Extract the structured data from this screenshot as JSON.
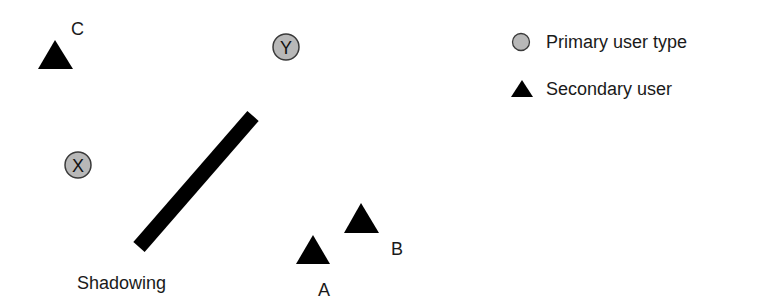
{
  "diagram": {
    "colors": {
      "primary_fill": "#b8b8b8",
      "primary_stroke": "#3a3a3a",
      "secondary_fill": "#000000",
      "barrier": "#000000",
      "text": "#1a1a1a"
    },
    "primary_users": [
      {
        "id": "Y",
        "label": "Y",
        "cx": 286,
        "cy": 47,
        "r": 13
      },
      {
        "id": "X",
        "label": "X",
        "cx": 78,
        "cy": 165,
        "r": 13
      }
    ],
    "secondary_users": [
      {
        "id": "C",
        "label": "C",
        "apex": [
          55,
          40
        ],
        "base_left": [
          38,
          69
        ],
        "base_right": [
          73,
          69
        ],
        "label_pos": [
          71,
          20
        ]
      },
      {
        "id": "A",
        "label": "A",
        "apex": [
          313,
          235
        ],
        "base_left": [
          296,
          264
        ],
        "base_right": [
          330,
          264
        ],
        "label_pos": [
          318,
          281
        ]
      },
      {
        "id": "B",
        "label": "B",
        "apex": [
          361,
          203
        ],
        "base_left": [
          344,
          233
        ],
        "base_right": [
          379,
          233
        ],
        "label_pos": [
          391,
          240
        ]
      }
    ],
    "barrier": {
      "label": "Shadowing",
      "x1": 139,
      "y1": 247,
      "x2": 253,
      "y2": 116,
      "width": 15,
      "label_pos": [
        77,
        274
      ]
    },
    "legend": {
      "items": [
        {
          "symbol": "circle",
          "label": "Primary user type"
        },
        {
          "symbol": "triangle",
          "label": "Secondary user"
        }
      ]
    }
  }
}
